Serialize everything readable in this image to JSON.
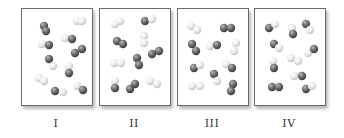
{
  "figure": {
    "atom_colors": {
      "dark": "#6b6b6b",
      "light": "#e6e6e6"
    },
    "panels": [
      {
        "label": "I",
        "left": 21,
        "molecules": [
          [
            [
              22,
              17,
              "d"
            ],
            [
              24,
              22,
              "d"
            ]
          ],
          [
            [
              55,
              12,
              "l"
            ],
            [
              60,
              12,
              "l"
            ]
          ],
          [
            [
              43,
              29,
              "l"
            ],
            [
              50,
              30,
              "d"
            ]
          ],
          [
            [
              20,
              35,
              "l"
            ],
            [
              27,
              36,
              "d"
            ]
          ],
          [
            [
              53,
              44,
              "d"
            ],
            [
              60,
              40,
              "d"
            ]
          ],
          [
            [
              27,
              50,
              "d"
            ],
            [
              31,
              57,
              "l"
            ]
          ],
          [
            [
              47,
              57,
              "l"
            ],
            [
              47,
              64,
              "d"
            ]
          ],
          [
            [
              17,
              69,
              "l"
            ],
            [
              22,
              72,
              "l"
            ]
          ],
          [
            [
              33,
              82,
              "d"
            ],
            [
              41,
              83,
              "l"
            ]
          ],
          [
            [
              55,
              77,
              "l"
            ],
            [
              61,
              81,
              "d"
            ]
          ]
        ]
      },
      {
        "label": "II",
        "left": 99,
        "molecules": [
          [
            [
              15,
              15,
              "l"
            ],
            [
              20,
              12,
              "l"
            ]
          ],
          [
            [
              45,
              12,
              "d"
            ],
            [
              52,
              10,
              "l"
            ]
          ],
          [
            [
              17,
              32,
              "d"
            ],
            [
              23,
              35,
              "d"
            ]
          ],
          [
            [
              44,
              27,
              "l"
            ],
            [
              44,
              34,
              "l"
            ]
          ],
          [
            [
              52,
              45,
              "d"
            ],
            [
              59,
              42,
              "d"
            ]
          ],
          [
            [
              14,
              54,
              "l"
            ],
            [
              21,
              54,
              "l"
            ]
          ],
          [
            [
              37,
              49,
              "d"
            ],
            [
              39,
              56,
              "d"
            ]
          ],
          [
            [
              15,
              72,
              "l"
            ],
            [
              15,
              79,
              "d"
            ]
          ],
          [
            [
              30,
              80,
              "d"
            ],
            [
              35,
              75,
              "d"
            ]
          ],
          [
            [
              50,
              72,
              "l"
            ],
            [
              57,
              75,
              "l"
            ]
          ]
        ]
      },
      {
        "label": "III",
        "left": 177,
        "molecules": [
          [
            [
              13,
              17,
              "l"
            ],
            [
              19,
              21,
              "l"
            ]
          ],
          [
            [
              46,
              19,
              "d"
            ],
            [
              53,
              19,
              "d"
            ]
          ],
          [
            [
              14,
              35,
              "d"
            ],
            [
              18,
              42,
              "d"
            ]
          ],
          [
            [
              32,
              37,
              "l"
            ],
            [
              39,
              36,
              "d"
            ]
          ],
          [
            [
              58,
              34,
              "l"
            ],
            [
              56,
              42,
              "l"
            ]
          ],
          [
            [
              16,
              59,
              "d"
            ],
            [
              22,
              56,
              "l"
            ]
          ],
          [
            [
              48,
              55,
              "l"
            ],
            [
              54,
              59,
              "d"
            ]
          ],
          [
            [
              36,
              65,
              "d"
            ],
            [
              39,
              72,
              "l"
            ]
          ],
          [
            [
              14,
              77,
              "l"
            ],
            [
              22,
              77,
              "l"
            ]
          ],
          [
            [
              55,
              75,
              "d"
            ],
            [
              53,
              82,
              "d"
            ]
          ]
        ]
      },
      {
        "label": "IV",
        "left": 254,
        "molecules": [
          [
            [
              14,
              19,
              "d"
            ],
            [
              20,
              15,
              "l"
            ]
          ],
          [
            [
              37,
              19,
              "l"
            ],
            [
              38,
              25,
              "d"
            ]
          ],
          [
            [
              51,
              15,
              "d"
            ],
            [
              55,
              21,
              "l"
            ]
          ],
          [
            [
              19,
              35,
              "d"
            ],
            [
              24,
              39,
              "l"
            ]
          ],
          [
            [
              53,
              44,
              "l"
            ],
            [
              59,
              40,
              "d"
            ]
          ],
          [
            [
              36,
              49,
              "l"
            ],
            [
              43,
              52,
              "l"
            ]
          ],
          [
            [
              18,
              52,
              "l"
            ],
            [
              19,
              59,
              "d"
            ]
          ],
          [
            [
              39,
              67,
              "l"
            ],
            [
              47,
              67,
              "d"
            ]
          ],
          [
            [
              17,
              78,
              "d"
            ],
            [
              24,
              78,
              "d"
            ]
          ],
          [
            [
              51,
              80,
              "d"
            ],
            [
              57,
              77,
              "l"
            ]
          ]
        ]
      }
    ]
  }
}
